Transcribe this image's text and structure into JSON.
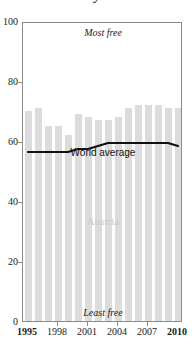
{
  "title": {
    "text_remnant": "y"
  },
  "chart_data": {
    "type": "bar",
    "title": "",
    "xlabel": "",
    "ylabel": "",
    "ylim": [
      0,
      100
    ],
    "grid": false,
    "legend_position": "inline-labels",
    "categories": [
      1995,
      1996,
      1997,
      1998,
      1999,
      2000,
      2001,
      2002,
      2003,
      2004,
      2005,
      2006,
      2007,
      2008,
      2009,
      2010
    ],
    "series": [
      {
        "name": "Austria",
        "type": "bar",
        "color": "#dcdcdc",
        "values": [
          70,
          71,
          65,
          65,
          62,
          69,
          68,
          67,
          67,
          68,
          71,
          72,
          72,
          72,
          71,
          71
        ]
      },
      {
        "name": "World average",
        "type": "line",
        "color": "#111111",
        "values": [
          57,
          57,
          57,
          57,
          57,
          58,
          58,
          59,
          60,
          60,
          60,
          60,
          60,
          60,
          60,
          59
        ]
      }
    ],
    "y_ticks": [
      0,
      20,
      40,
      60,
      80,
      100
    ],
    "x_ticks": [
      1995,
      1998,
      2001,
      2004,
      2007,
      2010
    ],
    "annotations": [
      {
        "text": "Most free",
        "position": "top-center"
      },
      {
        "text": "Least free",
        "position": "bottom-center"
      }
    ]
  },
  "axis": {
    "y_labels": [
      "0",
      "20",
      "40",
      "60",
      "80",
      "100"
    ],
    "x_labels": [
      "1995",
      "1998",
      "2001",
      "2004",
      "2007",
      "2010"
    ],
    "x_labels_bold": [
      "1995",
      "2010"
    ]
  },
  "annotations": {
    "most_free": "Most free",
    "least_free": "Least free",
    "country_label": "Austria",
    "world_label": "World average"
  },
  "colors": {
    "bar": "#dcdcdc",
    "line": "#111111",
    "frame": "#8b8b8b",
    "country_label": "#c9c9c9",
    "text": "#1a1a1a"
  }
}
